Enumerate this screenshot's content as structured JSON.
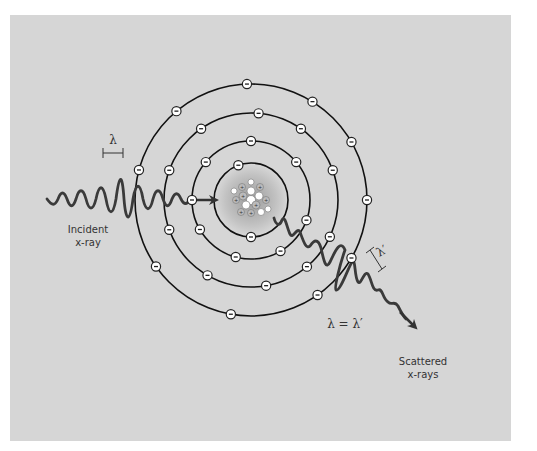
{
  "diagram": {
    "colors": {
      "background": "#d6d6d6",
      "page": "#ffffff",
      "line": "#111111",
      "wave": "#3a3a3a",
      "electron_fill": "#ffffff",
      "nucleus_glow": "#a8a8a8"
    },
    "labels": {
      "incident_line1": "Incident",
      "incident_line2": "x-ray",
      "lambda": "λ",
      "lambda_prime": "λ′",
      "equation": "λ = λ′",
      "scattered_line1": "Scattered",
      "scattered_line2": "x-rays"
    },
    "atom": {
      "center": [
        251,
        200
      ],
      "orbit_radii": [
        37,
        59,
        87,
        116
      ],
      "electron_symbol": "−",
      "proton_symbol": "+",
      "electron_counts": [
        2,
        8,
        10,
        10
      ]
    }
  }
}
